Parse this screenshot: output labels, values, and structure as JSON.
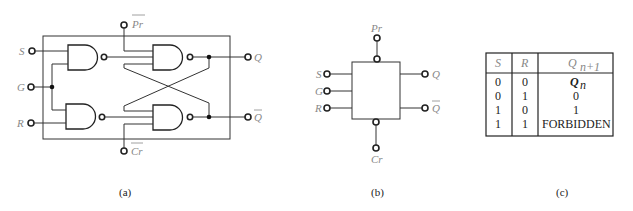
{
  "figure_a": {
    "caption": "(a)",
    "inputs": {
      "s": "S",
      "g": "G",
      "r": "R",
      "pr": "Pr",
      "cr": "Cr"
    },
    "outputs": {
      "q": "Q",
      "qbar": "Q"
    }
  },
  "figure_b": {
    "caption": "(b)",
    "pins": {
      "pr": "Pr",
      "s": "S",
      "g": "G",
      "r": "R",
      "cr": "Cr",
      "q": "Q",
      "qbar": "Q"
    }
  },
  "figure_c": {
    "caption": "(c)",
    "headers": {
      "s": "S",
      "r": "R",
      "q": "Q",
      "q_sub": "n+1"
    },
    "rows": [
      {
        "s": "0",
        "r": "0",
        "q": "Q",
        "q_sub": "n"
      },
      {
        "s": "0",
        "r": "1",
        "q": "0",
        "q_sub": ""
      },
      {
        "s": "1",
        "r": "0",
        "q": "1",
        "q_sub": ""
      },
      {
        "s": "1",
        "r": "1",
        "q": "FORBIDDEN",
        "q_sub": ""
      }
    ]
  }
}
